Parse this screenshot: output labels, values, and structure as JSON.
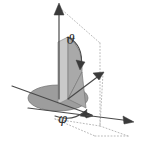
{
  "figure": {
    "kind": "spherical-coordinate-diagram",
    "background_color": "#ffffff",
    "width": 144,
    "height": 142,
    "labels": {
      "polar_angle": "ϑ",
      "azimuth_angle": "φ"
    },
    "colors": {
      "axis": "#4a4a4a",
      "arrowhead": "#3a3a3a",
      "dotted_guide": "#b9b9b9",
      "disk": "#9d9d9d",
      "vertical_plane": "#c9c9c9",
      "polar_sector": "#a9a9a9",
      "outline": "#7a7a7a"
    },
    "elements": {
      "z_axis_name": "z-axis",
      "x_axis_name": "x-axis",
      "y_axis_name": "y-axis",
      "radial_vector_name": "radial-vector",
      "disk_name": "equatorial-disk",
      "plane_name": "meridian-plane",
      "sector_name": "polar-angle-sector",
      "theta_arc_name": "polar-angle-arc",
      "phi_arc_name": "azimuth-angle-arc",
      "box_name": "dotted-bounding-box"
    },
    "geometry": {
      "origin": [
        68,
        99
      ],
      "z_tip": [
        59,
        4
      ],
      "y_tip": [
        133,
        122
      ],
      "x_tip": [
        12,
        86
      ],
      "radial_tip": [
        103,
        73
      ],
      "theta_value_deg": 48,
      "phi_value_deg": 58
    }
  }
}
